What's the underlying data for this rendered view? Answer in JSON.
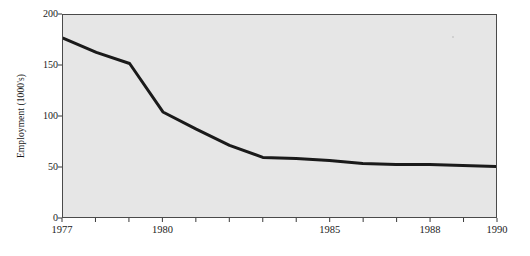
{
  "chart_data": {
    "type": "line",
    "title": "",
    "subtitle": "",
    "xlabel": "",
    "ylabel": "Employment (1000's)",
    "xlim": [
      1977,
      1990
    ],
    "ylim": [
      0,
      200
    ],
    "grid": false,
    "legend": null,
    "x": [
      1977,
      1978,
      1979,
      1980,
      1981,
      1982,
      1983,
      1984,
      1985,
      1986,
      1987,
      1988,
      1989,
      1990
    ],
    "values": [
      177,
      163,
      152,
      104,
      87,
      71,
      59,
      58,
      56,
      53,
      52,
      52,
      51,
      50
    ],
    "series": [
      {
        "name": "Employment",
        "values": [
          177,
          163,
          152,
          104,
          87,
          71,
          59,
          58,
          56,
          53,
          52,
          52,
          51,
          50
        ]
      }
    ],
    "ytick_values": [
      0,
      50,
      100,
      150,
      200
    ],
    "ytick_labels": [
      "0",
      "50",
      "100",
      "150",
      "200"
    ],
    "xtick_values": [
      1977,
      1978,
      1979,
      1980,
      1981,
      1982,
      1983,
      1984,
      1985,
      1986,
      1987,
      1988,
      1989,
      1990
    ],
    "xtick_labels_shown": [
      {
        "value": 1977,
        "label": "1977"
      },
      {
        "value": 1980,
        "label": "1980"
      },
      {
        "value": 1985,
        "label": "1985"
      },
      {
        "value": 1988,
        "label": "1988"
      },
      {
        "value": 1990,
        "label": "1990"
      }
    ],
    "colors": {
      "plot_background": "#e6e6e6",
      "figure_background": "#ffffff",
      "line": "#1a1a1a",
      "axis": "#4a4a4a",
      "text": "#1a1a1a"
    },
    "line_width_px": 3
  },
  "axis": {
    "ylabel": "Employment (1000's)",
    "y_ticks": [
      "200",
      "150",
      "100",
      "50",
      "0"
    ],
    "x_ticks": [
      "1977",
      "1980",
      "1985",
      "1988",
      "1990"
    ]
  }
}
